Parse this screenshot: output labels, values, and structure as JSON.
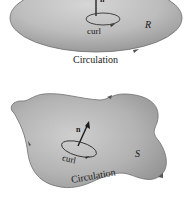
{
  "figure_top": {
    "region_label": "R",
    "normal_label": "n",
    "curl_label": "curl",
    "boundary_label": "Circulation"
  },
  "figure_bottom": {
    "surface_label": "S",
    "normal_label": "n",
    "curl_label": "curl",
    "boundary_label": "Circulation"
  },
  "colors": {
    "surface_fill": "#b8b8b8",
    "surface_edge": "#6e6e6e",
    "ink": "#1a1a1a"
  }
}
